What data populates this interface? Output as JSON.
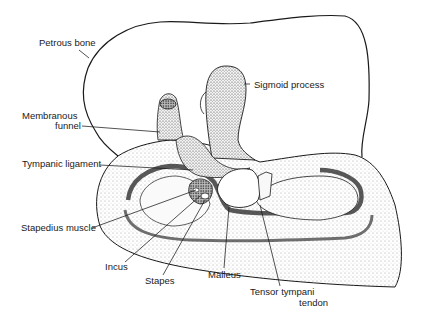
{
  "figure": {
    "labels": {
      "petrous_bone": "Petrous bone",
      "sigmoid_process": "Sigmoid process",
      "membranous_funnel_line1": "Membranous",
      "membranous_funnel_line2": "funnel",
      "tympanic_ligament": "Tympanic ligament",
      "stapedius_muscle": "Stapedius muscle",
      "incus": "Incus",
      "stapes": "Stapes",
      "malleus": "Malleus",
      "tensor_tympani_line1": "Tensor tympani",
      "tensor_tympani_line2": "tendon"
    },
    "colors": {
      "ink": "#1a1a1a",
      "background": "#ffffff",
      "stipple": "#555555"
    }
  }
}
